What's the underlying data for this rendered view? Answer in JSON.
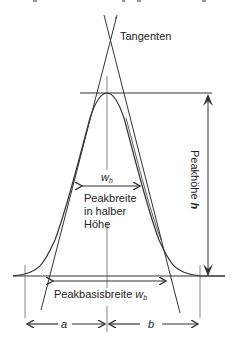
{
  "diagram": {
    "type": "chromatography-peak",
    "labels": {
      "tangents": "Tangenten",
      "wh_symbol": "w",
      "wh_sub": "h",
      "half_width_line1": "Peakbreite",
      "half_width_line2": "in halber",
      "half_width_line3": "Höhe",
      "height_label": "Peakhöhe ",
      "height_symbol": "h",
      "base_width": "Peakbasisbreite ",
      "base_width_symbol": "w",
      "base_width_sub": "b",
      "a": "a",
      "b": "b"
    },
    "colors": {
      "line": "#333333",
      "text": "#222222",
      "background": "#ffffff"
    }
  }
}
